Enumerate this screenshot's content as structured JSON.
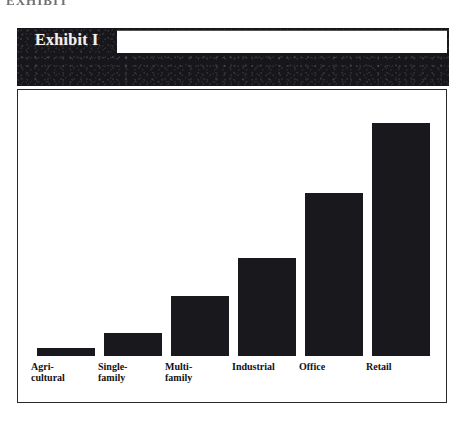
{
  "page": {
    "top_fragment_text": "EXHIBIT",
    "background_color": "#ffffff"
  },
  "exhibit": {
    "label": "Exhibit I",
    "title": "",
    "header_background": "#17161a",
    "header_text_color": "#f2f1ee",
    "panel_background": "#ffffff",
    "panel_border_color": "#2a282c"
  },
  "chart_data": {
    "type": "bar",
    "title": "",
    "xlabel": "",
    "ylabel": "",
    "grid": false,
    "legend": null,
    "ylim": [
      0,
      100
    ],
    "bar_color": "#19181c",
    "categories": [
      "Agri-cultural",
      "Single-family",
      "Multi-family",
      "Industrial",
      "Office",
      "Retail"
    ],
    "category_lines": [
      [
        "Agri-",
        "cultural"
      ],
      [
        "Single-",
        "family"
      ],
      [
        "Multi-",
        "family"
      ],
      [
        "Industrial"
      ],
      [
        "Office"
      ],
      [
        "Retail"
      ]
    ],
    "values": [
      3,
      9,
      24,
      39,
      65,
      93
    ]
  }
}
